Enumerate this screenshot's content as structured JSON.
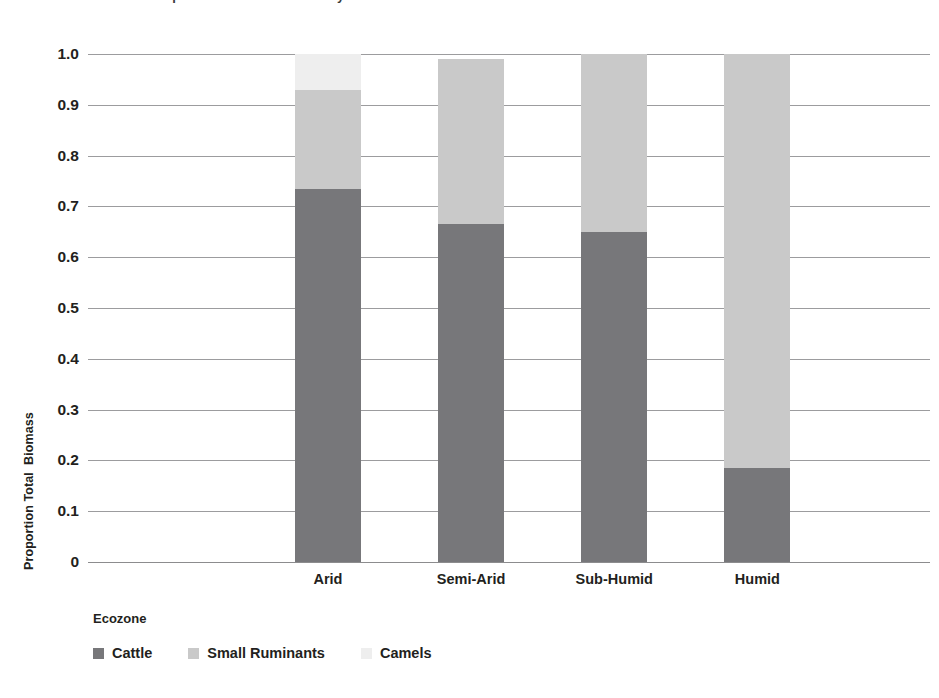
{
  "clipped_title": "Proportion of total biomass by ecozone",
  "chart_data": {
    "type": "bar",
    "subtype": "stacked-100",
    "title": "",
    "xlabel": "Ecozone",
    "ylabel": "Proportion Total  Biomass",
    "categories": [
      "Arid",
      "Semi-Arid",
      "Sub-Humid",
      "Humid"
    ],
    "series": [
      {
        "name": "Cattle",
        "color": "#77777a",
        "values": [
          0.735,
          0.665,
          0.65,
          0.185
        ]
      },
      {
        "name": "Small Ruminants",
        "color": "#c9c9c9",
        "values": [
          0.195,
          0.325,
          0.35,
          0.815
        ]
      },
      {
        "name": "Camels",
        "color": "#eeeeee",
        "values": [
          0.07,
          0.0,
          0.0,
          0.0
        ]
      }
    ],
    "ylim": [
      0,
      1.0
    ],
    "ytick_labels": [
      "1.0",
      "0.9",
      "0.8",
      "0.7",
      "0.6",
      "0.5",
      "0.4",
      "0.3",
      "0.2",
      "0.1",
      "0"
    ],
    "ytick_values": [
      1.0,
      0.9,
      0.8,
      0.7,
      0.6,
      0.5,
      0.4,
      0.3,
      0.2,
      0.1,
      0
    ],
    "grid": true,
    "legend_position": "bottom-left",
    "bar_tops": [
      1.0,
      0.99,
      1.0,
      1.0
    ]
  }
}
